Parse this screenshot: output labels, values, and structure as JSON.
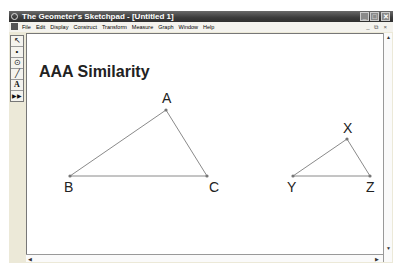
{
  "window": {
    "title": "The Geometer's Sketchpad - [Untitled 1]",
    "controls": {
      "minimize": "_",
      "maximize": "□",
      "close": "✕"
    }
  },
  "menubar": {
    "items": [
      "File",
      "Edit",
      "Display",
      "Construct",
      "Transform",
      "Measure",
      "Graph",
      "Window",
      "Help"
    ],
    "mdi_controls": {
      "minimize": "_",
      "restore": "⧉",
      "close": "×"
    }
  },
  "toolbox": {
    "tools": [
      {
        "name": "selection-arrow-tool",
        "glyph": "↖"
      },
      {
        "name": "point-tool",
        "glyph": "•"
      },
      {
        "name": "compass-tool",
        "glyph": "⊙"
      },
      {
        "name": "straightedge-tool",
        "glyph": "╱"
      },
      {
        "name": "text-tool",
        "glyph": "A"
      },
      {
        "name": "custom-tool",
        "glyph": "▶▶"
      }
    ]
  },
  "sketch": {
    "heading": "AAA Similarity",
    "triangle1": {
      "A": {
        "label": "A",
        "x": 166,
        "y": 110
      },
      "B": {
        "label": "B",
        "x": 70,
        "y": 176
      },
      "C": {
        "label": "C",
        "x": 207,
        "y": 176
      }
    },
    "triangle2": {
      "X": {
        "label": "X",
        "x": 347,
        "y": 139
      },
      "Y": {
        "label": "Y",
        "x": 293,
        "y": 176
      },
      "Z": {
        "label": "Z",
        "x": 370,
        "y": 176
      }
    },
    "line_color": "#8a8a8a",
    "point_color": "#777777"
  },
  "scrollbars": {
    "up": "▲",
    "down": "▼",
    "left": "◀",
    "right": "▶"
  }
}
